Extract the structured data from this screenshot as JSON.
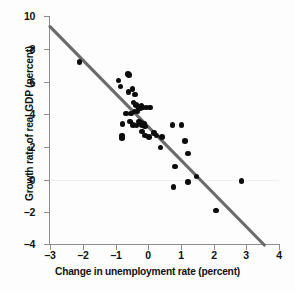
{
  "figure": {
    "background_color": "#ffffff",
    "point_color": "#0d0d0d",
    "trendline_color": "#6b6b6b",
    "axis_color": "#8d8d8d"
  },
  "chart_data": {
    "type": "scatter",
    "title": "",
    "xlabel": "Change in unemployment rate (percent)",
    "ylabel": "Growth rate of real GDP (percent)",
    "xlim": [
      -3,
      4
    ],
    "ylim": [
      -4,
      10
    ],
    "xticks": [
      -3,
      -2,
      -1,
      0,
      1,
      2,
      3,
      4
    ],
    "xticklabels": [
      "–3",
      "–2",
      "–1",
      "0",
      "1",
      "2",
      "3",
      "4"
    ],
    "yticks": [
      -4,
      -2,
      0,
      2,
      4,
      6,
      8,
      10
    ],
    "yticklabels": [
      "–4",
      "–2",
      "0",
      "2",
      "4",
      "6",
      "8",
      "10"
    ],
    "grid": false,
    "legend": null,
    "series": [
      {
        "name": "Okun's law observations",
        "type": "scatter",
        "marker": "circle",
        "color": "#0d0d0d",
        "points": [
          [
            -2.1,
            7.2
          ],
          [
            -0.9,
            6.05
          ],
          [
            -0.85,
            5.7
          ],
          [
            -0.62,
            6.45
          ],
          [
            -0.58,
            6.4
          ],
          [
            -0.6,
            5.35
          ],
          [
            -0.48,
            5.55
          ],
          [
            -0.4,
            5.2
          ],
          [
            -0.45,
            4.7
          ],
          [
            -0.38,
            4.55
          ],
          [
            -0.3,
            4.45
          ],
          [
            -0.25,
            4.35
          ],
          [
            -0.32,
            4.2
          ],
          [
            -0.42,
            4.15
          ],
          [
            -0.52,
            4.05
          ],
          [
            -0.68,
            4.05
          ],
          [
            -0.2,
            4.5
          ],
          [
            -0.15,
            4.4
          ],
          [
            -0.05,
            4.4
          ],
          [
            0.05,
            4.4
          ],
          [
            -0.78,
            3.4
          ],
          [
            -0.55,
            3.55
          ],
          [
            -0.47,
            3.35
          ],
          [
            -0.35,
            3.3
          ],
          [
            -0.28,
            3.55
          ],
          [
            -0.22,
            3.45
          ],
          [
            -0.18,
            3.35
          ],
          [
            -0.12,
            3.4
          ],
          [
            -0.1,
            3.25
          ],
          [
            -0.8,
            2.7
          ],
          [
            -0.8,
            2.55
          ],
          [
            -0.18,
            2.95
          ],
          [
            -0.1,
            2.7
          ],
          [
            0.02,
            2.6
          ],
          [
            0.18,
            2.85
          ],
          [
            0.25,
            2.7
          ],
          [
            0.42,
            2.6
          ],
          [
            0.38,
            1.95
          ],
          [
            0.75,
            3.35
          ],
          [
            1.02,
            3.35
          ],
          [
            1.12,
            2.35
          ],
          [
            1.22,
            1.6
          ],
          [
            0.82,
            0.8
          ],
          [
            0.78,
            -0.45
          ],
          [
            1.22,
            -0.15
          ],
          [
            1.48,
            0.2
          ],
          [
            2.08,
            -1.9
          ],
          [
            2.85,
            -0.1
          ]
        ]
      },
      {
        "name": "fitted regression line",
        "type": "line",
        "color": "#6b6b6b",
        "endpoints": [
          [
            -3.0,
            9.35
          ],
          [
            3.55,
            -4.0
          ]
        ],
        "slope": -2.04,
        "intercept": 3.23
      }
    ]
  }
}
